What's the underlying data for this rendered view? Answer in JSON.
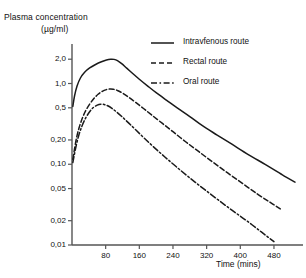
{
  "chart_data": {
    "type": "line",
    "title": "",
    "ylabel": "Plasma concentration",
    "yunit": "(µg/ml)",
    "xlabel": "Time (mins)",
    "yscale": "log",
    "xscale": "linear",
    "grid": false,
    "legend_position": "top-right",
    "xlim": [
      0,
      530
    ],
    "ylim": [
      0.01,
      2.6
    ],
    "xticks": [
      80,
      160,
      240,
      320,
      400,
      480
    ],
    "xticklabels": [
      "80",
      "160",
      "240",
      "320",
      "400",
      "480"
    ],
    "yticks": [
      0.01,
      0.02,
      0.05,
      0.1,
      0.2,
      0.5,
      1.0,
      2.0
    ],
    "yticklabels": [
      "0,01",
      "0,02",
      "0,05",
      "0,10",
      "0,20",
      "0,5",
      "1,0",
      "2,0"
    ],
    "series": [
      {
        "name": "Intravfenous route",
        "style": "solid",
        "points": [
          [
            2,
            0.52
          ],
          [
            6,
            0.7
          ],
          [
            12,
            0.93
          ],
          [
            20,
            1.17
          ],
          [
            30,
            1.38
          ],
          [
            42,
            1.56
          ],
          [
            56,
            1.72
          ],
          [
            70,
            1.86
          ],
          [
            82,
            1.96
          ],
          [
            92,
            2.0
          ],
          [
            100,
            1.99
          ],
          [
            108,
            1.92
          ],
          [
            118,
            1.76
          ],
          [
            130,
            1.55
          ],
          [
            145,
            1.32
          ],
          [
            160,
            1.13
          ],
          [
            180,
            0.93
          ],
          [
            200,
            0.77
          ],
          [
            225,
            0.62
          ],
          [
            250,
            0.5
          ],
          [
            280,
            0.39
          ],
          [
            310,
            0.3
          ],
          [
            345,
            0.23
          ],
          [
            380,
            0.177
          ],
          [
            420,
            0.131
          ],
          [
            460,
            0.099
          ],
          [
            500,
            0.074
          ],
          [
            530,
            0.06
          ]
        ]
      },
      {
        "name": "Rectal route",
        "style": "dashed",
        "points": [
          [
            2,
            0.115
          ],
          [
            6,
            0.155
          ],
          [
            11,
            0.215
          ],
          [
            17,
            0.285
          ],
          [
            24,
            0.365
          ],
          [
            32,
            0.455
          ],
          [
            42,
            0.555
          ],
          [
            52,
            0.65
          ],
          [
            62,
            0.735
          ],
          [
            72,
            0.8
          ],
          [
            82,
            0.84
          ],
          [
            90,
            0.855
          ],
          [
            98,
            0.85
          ],
          [
            108,
            0.82
          ],
          [
            120,
            0.76
          ],
          [
            134,
            0.68
          ],
          [
            150,
            0.59
          ],
          [
            170,
            0.49
          ],
          [
            190,
            0.405
          ],
          [
            215,
            0.32
          ],
          [
            240,
            0.253
          ],
          [
            270,
            0.19
          ],
          [
            300,
            0.145
          ],
          [
            335,
            0.106
          ],
          [
            370,
            0.078
          ],
          [
            405,
            0.058
          ],
          [
            440,
            0.043
          ],
          [
            470,
            0.034
          ],
          [
            495,
            0.028
          ]
        ]
      },
      {
        "name": "Oral route",
        "style": "dashdot",
        "points": [
          [
            2,
            0.105
          ],
          [
            6,
            0.135
          ],
          [
            11,
            0.18
          ],
          [
            17,
            0.237
          ],
          [
            24,
            0.3
          ],
          [
            32,
            0.37
          ],
          [
            41,
            0.44
          ],
          [
            50,
            0.5
          ],
          [
            60,
            0.54
          ],
          [
            68,
            0.555
          ],
          [
            76,
            0.55
          ],
          [
            85,
            0.53
          ],
          [
            95,
            0.492
          ],
          [
            107,
            0.44
          ],
          [
            120,
            0.383
          ],
          [
            135,
            0.323
          ],
          [
            152,
            0.265
          ],
          [
            172,
            0.21
          ],
          [
            195,
            0.162
          ],
          [
            220,
            0.124
          ],
          [
            248,
            0.093
          ],
          [
            278,
            0.069
          ],
          [
            310,
            0.051
          ],
          [
            345,
            0.037
          ],
          [
            380,
            0.027
          ],
          [
            415,
            0.02
          ],
          [
            450,
            0.0145
          ],
          [
            480,
            0.011
          ]
        ]
      }
    ]
  },
  "legend": {
    "items": [
      {
        "label": "Intravfenous route",
        "style": "solid"
      },
      {
        "label": "Rectal route",
        "style": "dashed"
      },
      {
        "label": "Oral route",
        "style": "dashdot"
      }
    ]
  },
  "colors": {
    "ink": "#1a1a1a",
    "axis": "#555555",
    "background": "#ffffff"
  }
}
